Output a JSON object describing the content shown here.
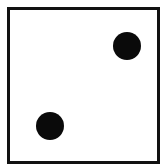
{
  "die": {
    "value": 2,
    "face_color": "#ffffff",
    "border_color": "#111111",
    "pip_color": "#0a0a0a",
    "pips": [
      {
        "position": "top-right",
        "cx": 123,
        "cy": 46,
        "r": 14
      },
      {
        "position": "bottom-left",
        "cx": 46,
        "cy": 126,
        "r": 14
      }
    ]
  }
}
